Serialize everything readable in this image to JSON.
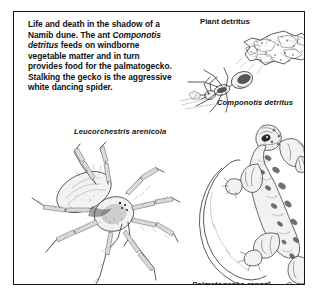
{
  "figure": {
    "caption_paragraph": {
      "segments": [
        {
          "text": "Life and death in the shadow of a Namib dune. The ant ",
          "style": "roman"
        },
        {
          "text": "Componotis detritus",
          "style": "italic"
        },
        {
          "text": " feeds on windborne vegetable matter and in turn provides food for the palmatogecko. Stalking the gecko is the aggressive white dancing spider.",
          "style": "roman"
        }
      ],
      "plain": "Life and death in the shadow of a Namib dune. The ant Componotis detritus feeds on windborne vegetable matter and in turn provides food for the palmatogecko. Stalking the gecko is the aggressive white dancing spider."
    },
    "labels": {
      "plant_detritus": "Plant detritus",
      "ant_species": "Componotis detritus",
      "spider_species": "Leucorchestris arenicola",
      "gecko_species": "Palmatogecko rangei"
    },
    "illustrations": [
      {
        "name": "plant-detritus-illustration",
        "subject": "Plant detritus",
        "style": "pen-and-ink stipple"
      },
      {
        "name": "ant-illustration",
        "subject": "Componotis detritus",
        "style": "pen-and-ink line drawing"
      },
      {
        "name": "spider-illustration",
        "subject": "Leucorchestris arenicola",
        "style": "pen-and-ink stipple"
      },
      {
        "name": "gecko-illustration",
        "subject": "Palmatogecko rangei",
        "style": "pen-and-ink stipple"
      }
    ],
    "colors": {
      "ink": "#232427",
      "text": "#101114",
      "background": "#ffffff",
      "frame": "#17181a"
    }
  }
}
